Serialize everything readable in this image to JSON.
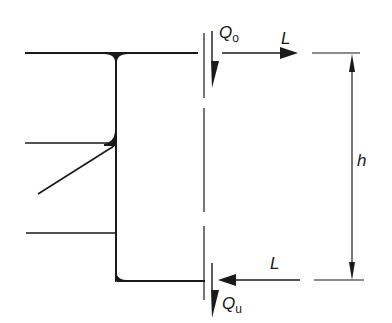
{
  "diagram": {
    "type": "structural force diagram (beam-to-column connection)",
    "colors": {
      "stroke": "#1a1a1a",
      "background": "#ffffff"
    },
    "labels": {
      "shear_top": {
        "symbol": "Q",
        "subscript": "o"
      },
      "shear_bottom": {
        "symbol": "Q",
        "subscript": "u"
      },
      "force_top": "L",
      "force_bottom": "L",
      "height": "h"
    },
    "elements": [
      "top flange line",
      "vertical web",
      "bottom flange line",
      "stiffener line",
      "diagonal brace",
      "lower horizontal line",
      "dashed cut line",
      "height dimension"
    ]
  }
}
